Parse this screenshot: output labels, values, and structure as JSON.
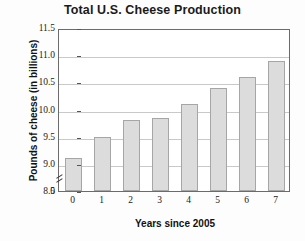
{
  "chart_data": {
    "type": "bar",
    "title": "Total U.S. Cheese Production",
    "xlabel": "Years since 2005",
    "ylabel": "Pounds of cheese (in billions)",
    "categories": [
      "0",
      "1",
      "2",
      "3",
      "4",
      "5",
      "6",
      "7"
    ],
    "values": [
      9.1,
      9.5,
      9.8,
      9.85,
      10.1,
      10.4,
      10.6,
      10.9
    ],
    "ylim": [
      8.5,
      11.5
    ],
    "yticks": [
      "11.5",
      "11.0",
      "10.5",
      "10.0",
      "9.5",
      "9.0",
      "8.5",
      "0"
    ],
    "ytick_values": [
      11.5,
      11.0,
      10.5,
      10.0,
      9.5,
      9.0,
      8.5,
      0
    ],
    "axis_break": true,
    "grid": true,
    "legend": "none",
    "bar_color": "#dcdcdc",
    "bar_border_color": "#a6a6a6",
    "grid_color": "#c9c9c9",
    "frame_color": "#6b6b6b"
  }
}
